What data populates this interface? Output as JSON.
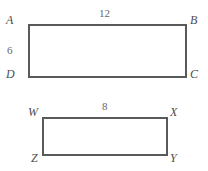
{
  "figure": {
    "background_color": "#ffffff",
    "stroke_color": "#595959",
    "label_color": "#4d4d4d",
    "measure_color": "#666666",
    "shapes": [
      {
        "name": "rectangle-abcd",
        "vertices": [
          "A",
          "B",
          "C",
          "D"
        ],
        "x": 28,
        "y": 24,
        "width": 158,
        "height": 53,
        "measures": [
          {
            "name": "top-length",
            "value": "12"
          },
          {
            "name": "left-height",
            "value": "6"
          }
        ]
      },
      {
        "name": "rectangle-wxyz",
        "vertices": [
          "W",
          "X",
          "Y",
          "Z"
        ],
        "x": 42,
        "y": 117,
        "width": 125,
        "height": 38,
        "measures": [
          {
            "name": "top-length",
            "value": "8"
          }
        ]
      }
    ],
    "labels": {
      "a": "A",
      "b": "B",
      "c": "C",
      "d": "D",
      "w": "W",
      "x": "X",
      "y": "Y",
      "z": "Z"
    },
    "measures": {
      "abcd_top": "12",
      "abcd_left": "6",
      "wxyz_top": "8"
    }
  }
}
